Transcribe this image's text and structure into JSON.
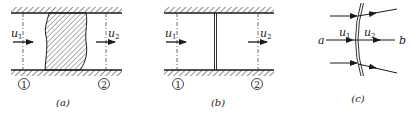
{
  "panels": [
    {
      "id": "a",
      "caption": "(a)",
      "inlet_velocity": "u",
      "inlet_sub": "1",
      "outlet_velocity": "u",
      "outlet_sub": "2",
      "section_1": "1",
      "section_2": "2",
      "element": "finite-thickness hatched wave region"
    },
    {
      "id": "b",
      "caption": "(b)",
      "inlet_velocity": "u",
      "inlet_sub": "1",
      "outlet_velocity": "u",
      "outlet_sub": "2",
      "section_1": "1",
      "section_2": "2",
      "element": "thin discontinuity plane"
    },
    {
      "id": "c",
      "caption": "(c)",
      "left_label": "a",
      "right_label": "b",
      "inlet_velocity": "u",
      "inlet_sub": "1",
      "outlet_velocity": "u",
      "outlet_sub": "2",
      "element": "curved discontinuity with streamlines"
    }
  ],
  "colors": {
    "ink": "#1a1a1a",
    "background": "#ffffff"
  }
}
